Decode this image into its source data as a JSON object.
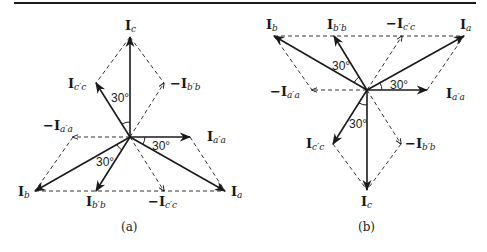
{
  "diagram": {
    "type": "phasor-diagram",
    "panels": [
      {
        "id": "a",
        "caption": "(a)",
        "labels": {
          "Ic": {
            "main": "I",
            "sub": "c"
          },
          "Icc": {
            "main": "I",
            "sub": "c′c"
          },
          "negIbb": {
            "main": "−I",
            "sub": "b′b"
          },
          "negIaa": {
            "main": "−I",
            "sub": "a′a"
          },
          "Iaa": {
            "main": "I",
            "sub": "a′a"
          },
          "Ib": {
            "main": "I",
            "sub": "b"
          },
          "Ibb": {
            "main": "I",
            "sub": "b′b"
          },
          "negIcc": {
            "main": "−I",
            "sub": "c′c"
          },
          "Ia": {
            "main": "I",
            "sub": "a"
          }
        },
        "angles": [
          "30°",
          "30°",
          "30°"
        ]
      },
      {
        "id": "b",
        "caption": "(b)",
        "labels": {
          "Ib": {
            "main": "I",
            "sub": "b"
          },
          "Ibb": {
            "main": "I",
            "sub": "b′b"
          },
          "negIcc": {
            "main": "−I",
            "sub": "c′c"
          },
          "Ia": {
            "main": "I",
            "sub": "a"
          },
          "negIaa": {
            "main": "−I",
            "sub": "a′a"
          },
          "Iaa": {
            "main": "I",
            "sub": "a′a"
          },
          "Icc": {
            "main": "I",
            "sub": "c′c"
          },
          "negIbb": {
            "main": "−I",
            "sub": "b′b"
          },
          "Ic": {
            "main": "I",
            "sub": "c"
          }
        },
        "angles": [
          "30°",
          "30°",
          "30°"
        ]
      }
    ],
    "colors": {
      "line": "#1a1a1a",
      "dash": "#333333"
    }
  }
}
